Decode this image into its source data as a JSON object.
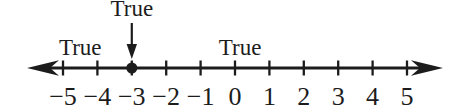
{
  "figure": {
    "type": "number_line",
    "axis": {
      "min": -5,
      "max": 5,
      "step": 1,
      "arrows": "both"
    },
    "ticks": [
      {
        "value": -5,
        "label": "−5"
      },
      {
        "value": -4,
        "label": "−4"
      },
      {
        "value": -3,
        "label": "−3"
      },
      {
        "value": -2,
        "label": "−2"
      },
      {
        "value": -1,
        "label": "−1"
      },
      {
        "value": 0,
        "label": "0"
      },
      {
        "value": 1,
        "label": "1"
      },
      {
        "value": 2,
        "label": "2"
      },
      {
        "value": 3,
        "label": "3"
      },
      {
        "value": 4,
        "label": "4"
      },
      {
        "value": 5,
        "label": "5"
      }
    ],
    "point": {
      "value": -3,
      "style": "filled-dot"
    },
    "labels": [
      {
        "text": "True",
        "at_value": -4.5,
        "row": "lower"
      },
      {
        "text": "True",
        "at_value": -3,
        "row": "upper",
        "arrow_to_value": -3
      },
      {
        "text": "True",
        "at_value": 0.15,
        "row": "lower"
      }
    ],
    "colors": {
      "ink": "#1c1c1c",
      "background": "#ffffff"
    }
  }
}
